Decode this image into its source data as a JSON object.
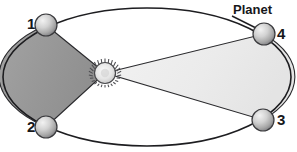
{
  "diagram": {
    "labels": {
      "planet": "Planet",
      "point_1": "1",
      "point_2": "2",
      "point_3": "3",
      "point_4": "4"
    },
    "colors": {
      "background": "#ffffff",
      "orbit_stroke": "#1d1d20",
      "sector_near_fill": "#9b9b9b",
      "sector_far_fill": "#ececec",
      "sector_stroke": "#2a2a2d",
      "planet_fill": "#c8c8c8",
      "planet_stroke": "#3a3a3d",
      "sun_fill": "#e8e8e8",
      "sun_stroke": "#4a4a4d",
      "label_color": "#17171a"
    }
  },
  "chart_data": {
    "type": "scatter",
    "title": "Planet",
    "xlabel": "",
    "ylabel": "",
    "orbit": {
      "shape": "ellipse",
      "center_x": 147,
      "center_y": 77,
      "semi_major_x": 144,
      "semi_minor_y": 69
    },
    "focus": {
      "name": "Sun",
      "x": 105,
      "y": 73,
      "radius": 12
    },
    "categories": [
      "1",
      "2",
      "3",
      "4"
    ],
    "points": [
      {
        "label": "1",
        "x": 46,
        "y": 25,
        "radius": 11
      },
      {
        "label": "2",
        "x": 46,
        "y": 127,
        "radius": 11
      },
      {
        "label": "3",
        "x": 263,
        "y": 120,
        "radius": 11
      },
      {
        "label": "4",
        "x": 264,
        "y": 34,
        "radius": 11
      }
    ],
    "sectors": [
      {
        "name": "near-sun-sector",
        "from_point": "1",
        "to_point": "2",
        "shade": "dark",
        "fill": "#9b9b9b"
      },
      {
        "name": "far-sun-sector",
        "from_point": "4",
        "to_point": "3",
        "shade": "light",
        "fill": "#ececec"
      }
    ],
    "annotations": [
      {
        "text": "Planet",
        "x": 233,
        "y": 3,
        "target_point": "4"
      }
    ],
    "grid": false,
    "legend": "none"
  }
}
